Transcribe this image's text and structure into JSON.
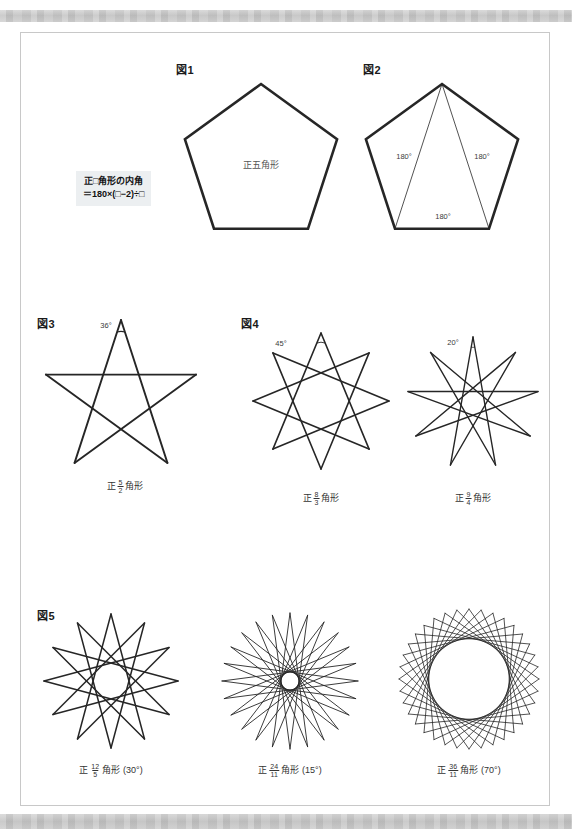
{
  "document": {
    "title": "正多角形の内角と星形多角形",
    "page_bg": "#ffffff",
    "card_border": "#c8c8c8",
    "band_color": "#c9c9c9",
    "stroke_color": "#262626"
  },
  "formula": {
    "line1": "正□角形の内角",
    "line2": "＝180×(□−2)÷□",
    "bg": "#eceff1"
  },
  "figures": [
    {
      "tag": "図1",
      "tag_x": 175,
      "tag_y": 60,
      "kind": "pentagon",
      "cx": 260,
      "cy": 163,
      "r": 80,
      "inner_label": "正五角形",
      "label_x": 260,
      "label_y": 163,
      "diagonals": false,
      "stroke_width": 2.6
    },
    {
      "tag": "図2",
      "tag_x": 362,
      "tag_y": 60,
      "kind": "pentagon",
      "cx": 441,
      "cy": 163,
      "r": 80,
      "inner_label": "",
      "diagonals": true,
      "stroke_width": 2.6,
      "diagonal_width": 0.8,
      "angle_labels": [
        {
          "text": "180°",
          "x": 403,
          "y": 155
        },
        {
          "text": "180°",
          "x": 481,
          "y": 155
        },
        {
          "text": "180°",
          "x": 442,
          "y": 215
        }
      ]
    },
    {
      "tag": "図3",
      "tag_x": 36,
      "tag_y": 314,
      "kind": "star",
      "n": 5,
      "k": 2,
      "cx": 120,
      "cy": 398,
      "r": 79,
      "rotation": -90,
      "stroke_width": 1.9,
      "angle_label": {
        "text": "36°",
        "x": 105,
        "y": 324
      },
      "arcs": true,
      "caption": {
        "prefix": "正",
        "num": "5",
        "den": "2",
        "suffix": "角形",
        "note": "",
        "x": 124,
        "y": 478
      }
    },
    {
      "tag": "図4",
      "tag_x": 240,
      "tag_y": 314,
      "kind": "star",
      "n": 8,
      "k": 3,
      "cx": 320,
      "cy": 400,
      "r": 68,
      "rotation": -90,
      "stroke_width": 1.6,
      "angle_label": {
        "text": "45°",
        "x": 280,
        "y": 342
      },
      "arcs": true,
      "caption": {
        "prefix": "正",
        "num": "8",
        "den": "3",
        "suffix": "角形",
        "note": "",
        "x": 320,
        "y": 490
      }
    },
    {
      "tag": "",
      "kind": "star",
      "n": 9,
      "k": 4,
      "cx": 472,
      "cy": 402,
      "r": 66,
      "rotation": -90,
      "stroke_width": 1.4,
      "angle_label": {
        "text": "20°",
        "x": 452,
        "y": 341
      },
      "arcs": true,
      "caption": {
        "prefix": "正",
        "num": "9",
        "den": "4",
        "suffix": "角形",
        "note": "",
        "x": 472,
        "y": 490
      }
    },
    {
      "tag": "図5",
      "tag_x": 36,
      "tag_y": 606,
      "kind": "star",
      "n": 12,
      "k": 5,
      "cx": 110,
      "cy": 680,
      "r": 67,
      "rotation": -90,
      "stroke_width": 1.5,
      "caption": {
        "prefix": "正",
        "num": "12",
        "den": "5",
        "suffix": "角形",
        "note": "(30°)",
        "x": 110,
        "y": 762
      }
    },
    {
      "tag": "",
      "kind": "star",
      "n": 24,
      "k": 11,
      "cx": 289,
      "cy": 680,
      "r": 68,
      "rotation": -90,
      "stroke_width": 0.9,
      "caption": {
        "prefix": "正",
        "num": "24",
        "den": "11",
        "suffix": "角形",
        "note": "(15°)",
        "x": 289,
        "y": 762
      }
    },
    {
      "tag": "",
      "kind": "star",
      "n": 36,
      "k": 11,
      "cx": 468,
      "cy": 678,
      "r": 70,
      "rotation": -90,
      "stroke_width": 0.8,
      "caption": {
        "prefix": "正",
        "num": "36",
        "den": "11",
        "suffix": "角形",
        "note": "(70°)",
        "x": 468,
        "y": 762
      }
    }
  ],
  "chart_data": {
    "type": "diagram",
    "series": [
      {
        "name": "正五角形",
        "n": 5,
        "k": 1,
        "interior_angle": 108,
        "point_angle": null
      },
      {
        "name": "正5/2角形",
        "n": 5,
        "k": 2,
        "point_angle": 36
      },
      {
        "name": "正8/3角形",
        "n": 8,
        "k": 3,
        "point_angle": 45
      },
      {
        "name": "正9/4角形",
        "n": 9,
        "k": 4,
        "point_angle": 20
      },
      {
        "name": "正12/5角形",
        "n": 12,
        "k": 5,
        "point_angle": 30
      },
      {
        "name": "正24/11角形",
        "n": 24,
        "k": 11,
        "point_angle": 15
      },
      {
        "name": "正36/11角形",
        "n": 36,
        "k": 11,
        "point_angle": 70
      }
    ],
    "formula": "正□角形の内角 ＝ 180×(□−2)÷□"
  }
}
